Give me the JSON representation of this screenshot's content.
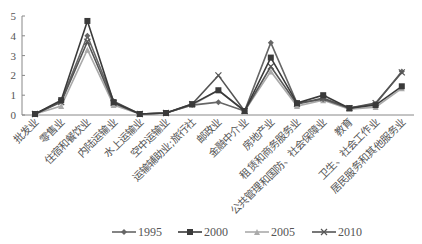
{
  "chart_data": {
    "type": "line",
    "title": "",
    "xlabel": "",
    "ylabel": "",
    "ylim": [
      0,
      5
    ],
    "yticks": [
      0,
      1,
      2,
      3,
      4,
      5
    ],
    "grid": false,
    "legend_position": "bottom",
    "categories": [
      "批发业",
      "零售业",
      "住宿和餐饮业",
      "内陆运输业",
      "水上运输业",
      "空中运输业",
      "运输辅助业;旅行社",
      "邮政业",
      "金融中介业",
      "房地产业",
      "租赁和商务服务业",
      "公共管理和国防、社会保障业",
      "教育",
      "卫生、社会工作业",
      "居民服务和其他服务业"
    ],
    "series": [
      {
        "name": "1995",
        "marker": "diamond",
        "color": "#666666",
        "values": [
          0.05,
          0.7,
          4.0,
          0.7,
          0.05,
          0.1,
          0.5,
          0.65,
          0.2,
          3.65,
          0.6,
          0.8,
          0.35,
          0.55,
          2.2
        ]
      },
      {
        "name": "2000",
        "marker": "square",
        "color": "#3a3a3a",
        "values": [
          0.05,
          0.75,
          4.75,
          0.65,
          0.05,
          0.1,
          0.55,
          1.25,
          0.2,
          2.9,
          0.6,
          1.0,
          0.35,
          0.5,
          1.45
        ]
      },
      {
        "name": "2005",
        "marker": "triangle",
        "color": "#aaaaaa",
        "values": [
          0.05,
          0.45,
          3.3,
          0.5,
          0.05,
          0.1,
          0.5,
          1.25,
          0.2,
          2.2,
          0.45,
          0.75,
          0.3,
          0.4,
          1.35
        ]
      },
      {
        "name": "2010",
        "marker": "cross",
        "color": "#555555",
        "values": [
          0.05,
          0.65,
          3.7,
          0.6,
          0.05,
          0.1,
          0.55,
          2.0,
          0.2,
          2.45,
          0.55,
          0.85,
          0.35,
          0.6,
          2.15
        ]
      }
    ]
  }
}
